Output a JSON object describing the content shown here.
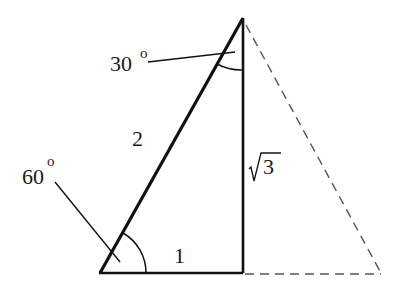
{
  "diagram": {
    "type": "30-60-90 right triangle",
    "labels": {
      "hypotenuse": "2",
      "short_leg": "1",
      "long_leg_radicand": "3",
      "angle_top_value": "30",
      "angle_bottom_value": "60",
      "degree_symbol": "o"
    },
    "vertices": {
      "top": [
        243,
        18
      ],
      "bottom_left": [
        100,
        273
      ],
      "right_angle": [
        243,
        273
      ],
      "dashed_far": [
        381,
        273
      ]
    },
    "colors": {
      "line": "#111111",
      "dashed": "#555555",
      "background": "#ffffff"
    }
  }
}
